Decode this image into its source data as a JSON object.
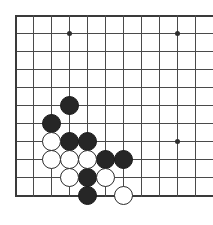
{
  "board": {
    "type": "go-board-diagram",
    "description": "Go board corner diagram showing a black and white stone fight",
    "grid": {
      "columns": 11,
      "rows": 11,
      "spacing_px": 18,
      "origin_x": 15,
      "origin_y": 15,
      "line_color": "#4a4a4a",
      "edge_color": "#3a3a3a",
      "background_color": "#ffffff"
    },
    "edges": {
      "left_is_board_edge": true,
      "top_is_board_edge": true,
      "bottom_is_board_edge": true,
      "right_is_board_edge": false
    },
    "star_points": [
      {
        "col": 3,
        "row": 1,
        "x": 69,
        "y": 33
      },
      {
        "col": 9,
        "row": 1,
        "x": 177,
        "y": 33
      },
      {
        "col": 9,
        "row": 7,
        "x": 177,
        "y": 141
      }
    ],
    "stones": [
      {
        "color": "black",
        "col": 3,
        "row": 5,
        "x": 69,
        "y": 105
      },
      {
        "color": "black",
        "col": 2,
        "row": 6,
        "x": 51,
        "y": 123
      },
      {
        "color": "black",
        "col": 3,
        "row": 7,
        "x": 69,
        "y": 141
      },
      {
        "color": "black",
        "col": 4,
        "row": 7,
        "x": 87,
        "y": 141
      },
      {
        "color": "black",
        "col": 5,
        "row": 8,
        "x": 105,
        "y": 159
      },
      {
        "color": "black",
        "col": 6,
        "row": 8,
        "x": 123,
        "y": 159
      },
      {
        "color": "black",
        "col": 4,
        "row": 9,
        "x": 87,
        "y": 177
      },
      {
        "color": "black",
        "col": 4,
        "row": 10,
        "x": 87,
        "y": 195
      },
      {
        "color": "white",
        "col": 2,
        "row": 7,
        "x": 51,
        "y": 141
      },
      {
        "color": "white",
        "col": 2,
        "row": 8,
        "x": 51,
        "y": 159
      },
      {
        "color": "white",
        "col": 3,
        "row": 8,
        "x": 69,
        "y": 159
      },
      {
        "color": "white",
        "col": 4,
        "row": 8,
        "x": 87,
        "y": 159
      },
      {
        "color": "white",
        "col": 3,
        "row": 9,
        "x": 69,
        "y": 177
      },
      {
        "color": "white",
        "col": 5,
        "row": 9,
        "x": 105,
        "y": 177
      },
      {
        "color": "white",
        "col": 6,
        "row": 10,
        "x": 123,
        "y": 195
      }
    ],
    "stone_counts": {
      "black": 8,
      "white": 7
    },
    "colors": {
      "black_stone": "#262626",
      "white_stone": "#ffffff",
      "white_stone_border": "#2b2b2b"
    }
  }
}
